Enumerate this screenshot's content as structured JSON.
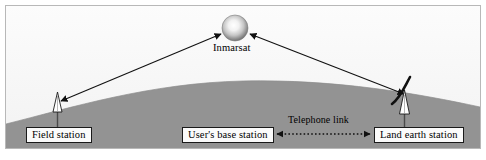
{
  "figure": {
    "type": "diagram",
    "background_color": "#f7f7f7",
    "earth_color": "#939393",
    "frame_color": "#b8b8b8",
    "line_color": "#1a1a1a"
  },
  "satellite": {
    "label": "Inmarsat",
    "icon": "satellite-sphere-icon",
    "center_x": 235,
    "center_y": 28,
    "radius": 13
  },
  "stations": {
    "field": {
      "label": "Field station",
      "icon": "antenna-tower-icon"
    },
    "base": {
      "label": "User's base station"
    },
    "land_earth": {
      "label": "Land earth station",
      "icon": "dish-antenna-icon"
    }
  },
  "links": {
    "uplink": {
      "name": "field-station-to-satellite-link",
      "style": "double-headed-solid-arrow"
    },
    "downlink": {
      "name": "satellite-to-land-earth-station-link",
      "style": "double-headed-solid-arrow"
    },
    "telephone": {
      "label": "Telephone link",
      "style": "double-headed-dotted-arrow"
    }
  }
}
